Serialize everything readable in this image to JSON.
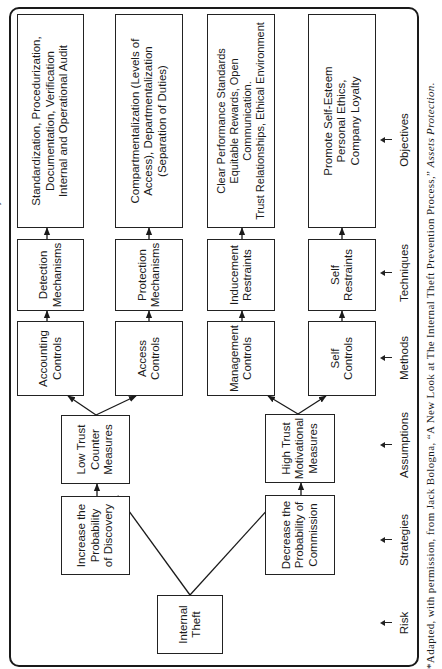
{
  "figure": {
    "side_title_fragment": "An Internal Theft Prevention System*",
    "nodes": {
      "risk": [
        "Internal",
        "Theft"
      ],
      "strategy_discovery": [
        "Increase the",
        "Probability",
        "of Discovery"
      ],
      "strategy_commission": [
        "Decrease the",
        "Probability of",
        "Commission"
      ],
      "assumption_low": [
        "Low Trust",
        "Counter",
        "Measures"
      ],
      "assumption_high": [
        "High Trust",
        "Motivational",
        "Measures"
      ],
      "method_accounting": [
        "Accounting",
        "Controls"
      ],
      "method_access": [
        "Access",
        "Controls"
      ],
      "method_management": [
        "Management",
        "Controls"
      ],
      "method_self": [
        "Self",
        "Controls"
      ],
      "technique_detection": [
        "Detection",
        "Mechanisms"
      ],
      "technique_protection": [
        "Protection",
        "Mechanisms"
      ],
      "technique_inducement": [
        "Inducement",
        "Restraints"
      ],
      "technique_self": [
        "Self",
        "Restraints"
      ],
      "objective_accounting": [
        "Standardization, Procedurization,",
        "Documentation, Verification",
        "Internal and Operational Audit"
      ],
      "objective_access": [
        "Compartmentalization (Levels of",
        "Access), Departmentalization",
        "(Separation of Duties)"
      ],
      "objective_management": [
        "Clear Performance Standards",
        "Equitable Rewards, Open",
        "Communication.",
        "Trust Relationships, Ethical Environment"
      ],
      "objective_self": [
        "Promote Self-Esteem",
        "Personal Ethics,",
        "Company Loyalty"
      ]
    },
    "column_labels": [
      "Risk",
      "Strategies",
      "Assumptions",
      "Methods",
      "Techniques",
      "Objectives"
    ],
    "footnote": {
      "text": "*Adapted, with permission, from Jack Bologna, “A New Look at The Internal Theft Prevention Process,” ",
      "source": "Assets Protection."
    },
    "colors": {
      "line": "#1a1a1a",
      "background": "#ffffff"
    }
  }
}
